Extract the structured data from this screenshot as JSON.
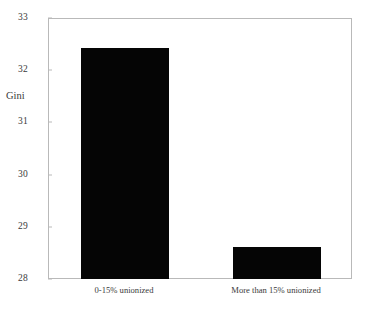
{
  "chart_data": {
    "type": "bar",
    "title": "",
    "xlabel": "",
    "ylabel": "Gini",
    "categories": [
      "0-15% unionized",
      "More than 15% unionized"
    ],
    "values": [
      32.45,
      28.63
    ],
    "ylim": [
      28,
      33
    ],
    "ytick_labels": [
      "28",
      "29",
      "30",
      "31",
      "32",
      "33"
    ],
    "ytick_values": [
      28,
      29,
      30,
      31,
      32,
      33
    ],
    "grid": false,
    "legend": "none",
    "bar_color": "#050505",
    "axis_color": "#b9b9b9",
    "text_color": "#3a3a3a"
  },
  "axis": {
    "y_title": "Gini"
  }
}
